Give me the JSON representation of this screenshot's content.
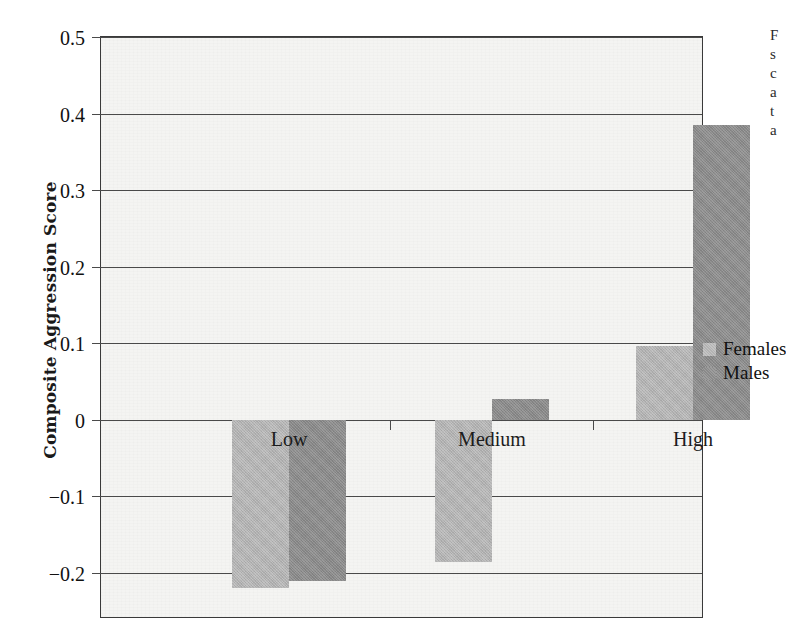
{
  "chart_data": {
    "type": "bar",
    "title": "",
    "subtitle": "",
    "xlabel": "",
    "ylabel": "Composite Aggression Score",
    "categories": [
      "Low",
      "Medium",
      "High"
    ],
    "series": [
      {
        "name": "Females",
        "color": "#b3b3b3",
        "values": [
          -0.22,
          -0.185,
          0.096
        ]
      },
      {
        "name": "Males",
        "color": "#8a8a8a",
        "values": [
          -0.21,
          0.027,
          0.385
        ]
      }
    ],
    "ylim": [
      -0.26,
      0.5
    ],
    "yticks": [
      0.5,
      0.4,
      0.3,
      0.2,
      0.1,
      0,
      -0.1,
      -0.2
    ],
    "ytick_labels": [
      "0.5",
      "0.4",
      "0.3",
      "0.2",
      "0.1",
      "0",
      "−0.1",
      "−0.2"
    ],
    "grid": true,
    "grid_axis": "y",
    "legend_position": "right",
    "legend_entries": [
      "Females",
      "Males"
    ],
    "panel_background": "#f4f4f2",
    "axis_color": "#4a4a4a"
  },
  "legend": {
    "items": [
      {
        "label": "Females",
        "swatch": "female"
      },
      {
        "label": "Males",
        "swatch": "male"
      }
    ]
  },
  "caption_sliver": {
    "lines": [
      "F",
      "s",
      "c",
      "a",
      "t",
      "a",
      "b"
    ]
  }
}
